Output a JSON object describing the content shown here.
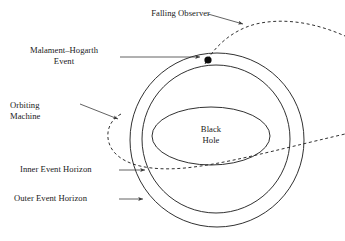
{
  "figure": {
    "background_color": "#ffffff",
    "line_color": "#1a1a1a",
    "text_color": "#1a1a1a"
  },
  "labels": {
    "falling_observer": "Falling Observer",
    "malament_hogarth_event": "Malament–Hogarth\nEvent",
    "orbiting_machine": "Orbiting\nMachine",
    "inner_event_horizon": "Inner Event Horizon",
    "outer_event_horizon": "Outer Event Horizon",
    "black_hole": "Black\nHole"
  },
  "shapes": {
    "outer_event_horizon": {
      "type": "circle",
      "name": "outer-event-horizon-circle",
      "cx": 217,
      "cy": 140,
      "r": 87,
      "stroke": "#1a1a1a",
      "fill": "none"
    },
    "inner_event_horizon": {
      "type": "circle",
      "name": "inner-event-horizon-circle",
      "cx": 216,
      "cy": 139,
      "r": 74,
      "stroke": "#1a1a1a",
      "fill": "none"
    },
    "black_hole": {
      "type": "ellipse",
      "name": "black-hole-ellipse",
      "cx": 211,
      "cy": 136,
      "rx": 59,
      "ry": 29,
      "stroke": "#1a1a1a",
      "fill": "none"
    },
    "mh_event_dot": {
      "type": "dot",
      "name": "malament-hogarth-event-dot",
      "cx": 208,
      "cy": 60,
      "r": 3.6,
      "fill": "#0d0d0d"
    },
    "falling_observer_path": {
      "type": "dashed-curve",
      "name": "falling-observer-trajectory",
      "dash": "3,2.6",
      "stroke": "#1a1a1a"
    },
    "orbiting_machine_path": {
      "type": "dashed-curve",
      "name": "orbiting-machine-trajectory",
      "dash": "3,2.6",
      "stroke": "#1a1a1a"
    }
  },
  "leader_lines": [
    {
      "name": "leader-falling-observer",
      "from": "Falling Observer label",
      "to": "falling observer dashed trajectory",
      "arrow": true
    },
    {
      "name": "leader-mh-event",
      "from": "Malament–Hogarth Event label",
      "to": "event dot on outer horizon",
      "arrow": true
    },
    {
      "name": "leader-orbiting-machine",
      "from": "Orbiting Machine label",
      "to": "orbiting machine dashed arc",
      "arrow": true
    },
    {
      "name": "leader-inner-horizon",
      "from": "Inner Event Horizon label",
      "to": "inner event horizon circle",
      "arrow": true
    },
    {
      "name": "leader-outer-horizon",
      "from": "Outer Event Horizon label",
      "to": "outer event horizon circle",
      "arrow": true
    }
  ]
}
